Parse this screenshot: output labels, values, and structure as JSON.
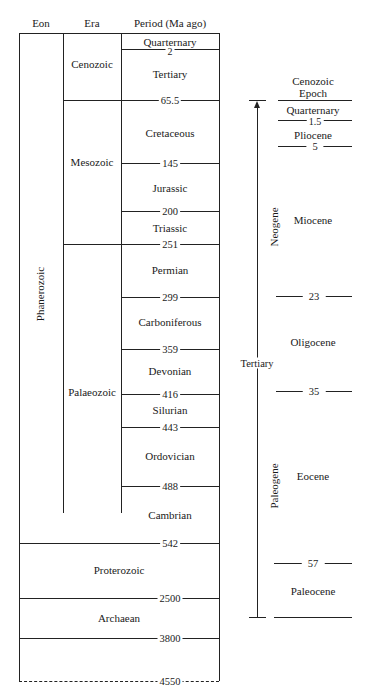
{
  "headers": {
    "eon": "Eon",
    "era": "Era",
    "period": "Period (Ma ago)"
  },
  "eons": [
    {
      "name": "Phanerozoic"
    },
    {
      "name": "Proterozoic"
    },
    {
      "name": "Archaean"
    }
  ],
  "eras": [
    {
      "name": "Cenozoic"
    },
    {
      "name": "Mesozoic"
    },
    {
      "name": "Palaeozoic"
    }
  ],
  "periods": [
    {
      "name": "Quarternary"
    },
    {
      "name": "Tertiary"
    },
    {
      "name": "Cretaceous"
    },
    {
      "name": "Jurassic"
    },
    {
      "name": "Triassic"
    },
    {
      "name": "Permian"
    },
    {
      "name": "Carboniferous"
    },
    {
      "name": "Devonian"
    },
    {
      "name": "Silurian"
    },
    {
      "name": "Ordovician"
    },
    {
      "name": "Cambrian"
    }
  ],
  "boundaries": [
    "2",
    "65.5",
    "145",
    "200",
    "251",
    "299",
    "359",
    "416",
    "443",
    "488",
    "542",
    "2500",
    "3800",
    "4550"
  ],
  "cenozoic": {
    "title_line1": "Cenozoic",
    "title_line2": "Epoch",
    "tertiary_label": "Tertiary",
    "neogene_label": "Neogene",
    "paleogene_label": "Paleogene",
    "epochs": [
      {
        "name": "Quarternary"
      },
      {
        "name": "Pliocene"
      },
      {
        "name": "Miocene"
      },
      {
        "name": "Oligocene"
      },
      {
        "name": "Eocene"
      },
      {
        "name": "Paleocene"
      }
    ],
    "boundaries": [
      "1.5",
      "5",
      "23",
      "35",
      "57"
    ]
  }
}
